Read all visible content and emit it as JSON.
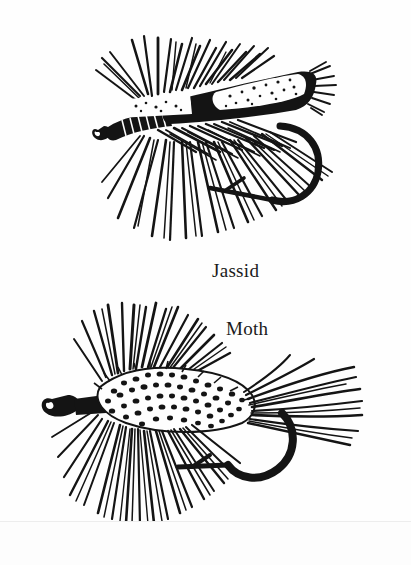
{
  "page": {
    "background_color": "#fefefe",
    "ink_color": "#141414",
    "width": 411,
    "height": 565,
    "kind": "scanned-book-illustration-page"
  },
  "figures": [
    {
      "id": "jassid",
      "caption": "Jassid",
      "subject": "artificial fishing fly",
      "style": "pen-and-ink line drawing",
      "bbox": [
        57,
        35,
        335,
        248
      ],
      "parts": [
        "hook eye loop",
        "ribbed black body",
        "speckled white flat wing",
        "dense radiating hackle fibers",
        "curved hook bend with barbed point"
      ]
    },
    {
      "id": "moth",
      "caption": "Moth",
      "subject": "artificial fishing fly",
      "style": "pen-and-ink line drawing",
      "bbox": [
        45,
        303,
        370,
        525
      ],
      "parts": [
        "hook eye loop",
        "mottled speckled body",
        "long splayed tail fibers",
        "dense radiating hackle fibers",
        "thick curved hook bend with barbed point"
      ]
    }
  ],
  "captions": {
    "jassid": "Jassid",
    "moth": "Moth"
  }
}
